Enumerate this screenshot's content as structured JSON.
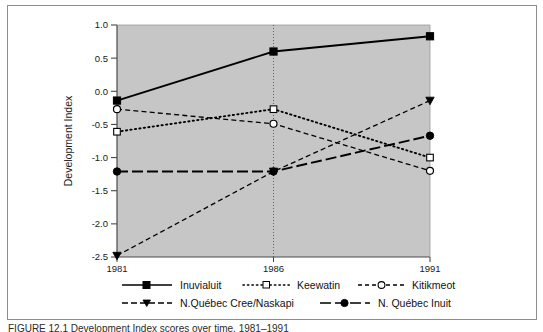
{
  "chart_data": {
    "type": "line",
    "title": "",
    "xlabel": "",
    "ylabel": "Development  Index",
    "x": [
      1981,
      1986,
      1991
    ],
    "xticklabels": [
      "1981",
      "1986",
      "1991"
    ],
    "yticklabels": [
      "1.0",
      "0.5",
      "0.0",
      "-0.5",
      "-1.0",
      "-1.5",
      "-2.0",
      "-2.5"
    ],
    "yticks": [
      1.0,
      0.5,
      0.0,
      -0.5,
      -1.0,
      -1.5,
      -2.0,
      -2.5
    ],
    "ylim": [
      -2.5,
      1.0
    ],
    "xlim": [
      1981,
      1991
    ],
    "grid": false,
    "plot_background": "#c6c6c6",
    "legend_position": "below-axes",
    "series": [
      {
        "name": "Inuvialuit",
        "values": [
          -0.14,
          0.6,
          0.83
        ],
        "line_style": "solid",
        "marker": "filled-square",
        "color": "#000000"
      },
      {
        "name": "Keewatin",
        "values": [
          -0.61,
          -0.27,
          -1.0
        ],
        "line_style": "dotted",
        "marker": "open-square",
        "color": "#000000"
      },
      {
        "name": "Kitikmeot",
        "values": [
          -0.27,
          -0.49,
          -1.2
        ],
        "line_style": "dashed",
        "marker": "open-circle",
        "color": "#000000"
      },
      {
        "name": "N.Québec Cree/Naskapi",
        "values": [
          -2.48,
          -1.21,
          -0.14
        ],
        "line_style": "dashed",
        "marker": "filled-triangle-down",
        "color": "#000000"
      },
      {
        "name": "N. Québec Inuit",
        "values": [
          -1.21,
          -1.21,
          -0.67
        ],
        "line_style": "long-dash",
        "marker": "filled-circle",
        "color": "#000000"
      }
    ]
  },
  "legend": {
    "entries": [
      {
        "label": "Inuvialuit"
      },
      {
        "label": "Keewatin"
      },
      {
        "label": "Kitikmeot"
      },
      {
        "label": "N.Québec Cree/Naskapi"
      },
      {
        "label": "N. Québec Inuit"
      }
    ]
  },
  "caption": {
    "text": "FIGURE  12.1  Development Index scores over time, 1981–1991"
  }
}
